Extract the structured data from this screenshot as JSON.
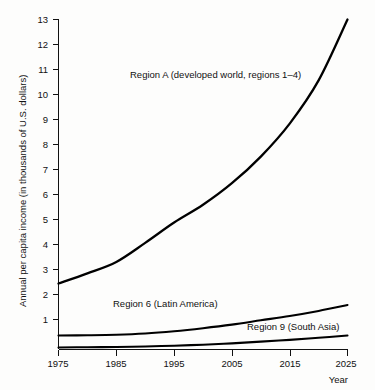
{
  "chart_data": {
    "type": "line",
    "title": "",
    "xlabel": "Year",
    "ylabel": "Annual per capita income (in thousands of U.S. dollars)",
    "xlim": [
      1975,
      2025
    ],
    "ylim": [
      0,
      13
    ],
    "grid": false,
    "legend_position": "inline-annotations",
    "xticks": [
      "1975",
      "1985",
      "1995",
      "2005",
      "2015",
      "2025"
    ],
    "xtick_values": [
      1975,
      1985,
      1995,
      2005,
      2015,
      2025
    ],
    "yticks": [
      "1",
      "2",
      "3",
      "4",
      "5",
      "6",
      "7",
      "8",
      "9",
      "10",
      "11",
      "12",
      "13"
    ],
    "ytick_values": [
      1,
      2,
      3,
      4,
      5,
      6,
      7,
      8,
      9,
      10,
      11,
      12,
      13
    ],
    "x": [
      1975,
      1980,
      1985,
      1990,
      1995,
      2000,
      2005,
      2010,
      2015,
      2020,
      2025
    ],
    "series": [
      {
        "name": "Region A (developed world, regions 1-4)",
        "label": "Region A (developed world, regions 1–4)",
        "values": [
          2.6,
          3.0,
          3.45,
          4.2,
          5.0,
          5.7,
          6.55,
          7.6,
          8.9,
          10.6,
          13.0
        ]
      },
      {
        "name": "Region 6 (Latin America)",
        "label": "Region 6 (Latin America)",
        "values": [
          0.55,
          0.56,
          0.58,
          0.63,
          0.72,
          0.84,
          0.98,
          1.15,
          1.32,
          1.52,
          1.75
        ]
      },
      {
        "name": "Region 9 (South Asia)",
        "label": "Region 9 (South Asia)",
        "values": [
          0.08,
          0.09,
          0.1,
          0.12,
          0.15,
          0.19,
          0.24,
          0.31,
          0.38,
          0.46,
          0.55
        ]
      }
    ],
    "annotations": [
      {
        "text": "Region A (developed world, regions –1–4)",
        "x": 1995,
        "y": 11.0
      },
      {
        "text": "Region 6 (Latin America)",
        "x": 1992,
        "y": 1.45
      },
      {
        "text": "Region 9 (South Asia)",
        "x": 2014,
        "y": 0.75
      }
    ],
    "colors": {
      "line": "#000000",
      "axis": "#111111",
      "text": "#111111",
      "background": "#fdfdfc"
    }
  },
  "axes": {
    "y_axis_title": "Annual per capita income (in thousands of U.S. dollars)",
    "x_axis_title": "Year"
  },
  "labels": {
    "region_a": "Region A (developed world, regions 1–4)",
    "region_6": "Region 6 (Latin America)",
    "region_9": "Region 9 (South Asia)"
  },
  "ytick": {
    "t1": "1",
    "t2": "2",
    "t3": "3",
    "t4": "4",
    "t5": "5",
    "t6": "6",
    "t7": "7",
    "t8": "8",
    "t9": "9",
    "t10": "10",
    "t11": "11",
    "t12": "12",
    "t13": "13"
  },
  "xtick": {
    "t1975": "1975",
    "t1985": "1985",
    "t1995": "1995",
    "t2005": "2005",
    "t2015": "2015",
    "t2025": "2025"
  }
}
